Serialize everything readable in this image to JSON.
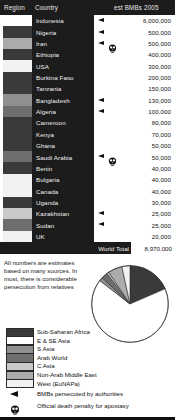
{
  "header": {
    "region_label": "Region",
    "country_label": "Country",
    "est_label": "est BMBs  2005"
  },
  "colors": {
    "sub_saharan_africa": "#3a3a3a",
    "e_se_asia": "#ffffff",
    "s_asia": "#8f8f8f",
    "arab_world": "#6e6e6e",
    "c_asia": "#c9c9c9",
    "non_arab_middle_east": "#ababab",
    "west_eunapa": "#f2f2f2",
    "header_bg": "#1c1c1c",
    "text_light": "#f0f0f0",
    "text_dark": "#111111"
  },
  "table": {
    "rows": [
      {
        "country": "Indonesia",
        "value": "6,000,000",
        "region": "e_se_asia",
        "persecuted": true,
        "death_penalty": false
      },
      {
        "country": "Nigeria",
        "value": "500,000",
        "region": "sub_saharan_africa",
        "persecuted": true,
        "death_penalty": false
      },
      {
        "country": "Iran",
        "value": "500,000",
        "region": "non_arab_middle_east",
        "persecuted": true,
        "death_penalty": true
      },
      {
        "country": "Ethiopia",
        "value": "400,000",
        "region": "sub_saharan_africa",
        "persecuted": false,
        "death_penalty": false
      },
      {
        "country": "USA",
        "value": "300,000",
        "region": "west_eunapa",
        "persecuted": false,
        "death_penalty": false
      },
      {
        "country": "Burkina Faso",
        "value": "200,000",
        "region": "sub_saharan_africa",
        "persecuted": false,
        "death_penalty": false
      },
      {
        "country": "Tanzania",
        "value": "150,000",
        "region": "sub_saharan_africa",
        "persecuted": false,
        "death_penalty": false
      },
      {
        "country": "Bangladesh",
        "value": "130,000",
        "region": "s_asia",
        "persecuted": true,
        "death_penalty": false
      },
      {
        "country": "Algeria",
        "value": "100,000",
        "region": "arab_world",
        "persecuted": true,
        "death_penalty": false
      },
      {
        "country": "Cameroon",
        "value": "80,000",
        "region": "sub_saharan_africa",
        "persecuted": false,
        "death_penalty": false
      },
      {
        "country": "Kenya",
        "value": "70,000",
        "region": "sub_saharan_africa",
        "persecuted": false,
        "death_penalty": false
      },
      {
        "country": "Ghana",
        "value": "50,000",
        "region": "sub_saharan_africa",
        "persecuted": false,
        "death_penalty": false
      },
      {
        "country": "Saudi Arabia",
        "value": "50,000",
        "region": "arab_world",
        "persecuted": true,
        "death_penalty": true
      },
      {
        "country": "Benin",
        "value": "40,000",
        "region": "sub_saharan_africa",
        "persecuted": false,
        "death_penalty": false
      },
      {
        "country": "Bulgaria",
        "value": "40,000",
        "region": "west_eunapa",
        "persecuted": false,
        "death_penalty": false
      },
      {
        "country": "Canada",
        "value": "40,000",
        "region": "west_eunapa",
        "persecuted": false,
        "death_penalty": false
      },
      {
        "country": "Uganda",
        "value": "30,000",
        "region": "sub_saharan_africa",
        "persecuted": false,
        "death_penalty": false
      },
      {
        "country": "Kazakhstan",
        "value": "25,000",
        "region": "c_asia",
        "persecuted": true,
        "death_penalty": false
      },
      {
        "country": "Sudan",
        "value": "25,000",
        "region": "arab_world",
        "persecuted": true,
        "death_penalty": false
      },
      {
        "country": "UK",
        "value": "20,000",
        "region": "west_eunapa",
        "persecuted": false,
        "death_penalty": false
      }
    ],
    "total_label": "World Total",
    "total_value": "8,970,000"
  },
  "note": "All numbers are estimates based on many sources. In most, there is considerable persecution from relatives",
  "chart_data": {
    "type": "pie",
    "title": "",
    "legend_position": "left",
    "categories": [
      "Sub-Saharan Africa",
      "E & SE Asia",
      "S Asia",
      "Arab World",
      "C Asia",
      "Non-Arab Middle East",
      "West (EuNAPa)"
    ],
    "values": [
      18.5,
      67.0,
      1.6,
      2.6,
      0.9,
      6.0,
      3.4
    ],
    "colors": [
      "#3a3a3a",
      "#ffffff",
      "#8f8f8f",
      "#6e6e6e",
      "#c9c9c9",
      "#ababab",
      "#f2f2f2"
    ]
  },
  "legend": {
    "items": [
      {
        "label": "Sub-Saharan Africa",
        "color_key": "sub_saharan_africa"
      },
      {
        "label": "E & SE Asia",
        "color_key": "e_se_asia"
      },
      {
        "label": "S Asia",
        "color_key": "s_asia"
      },
      {
        "label": "Arab World",
        "color_key": "arab_world"
      },
      {
        "label": "C Asia",
        "color_key": "c_asia"
      },
      {
        "label": "Non-Arab Middle East",
        "color_key": "non_arab_middle_east"
      },
      {
        "label": "West (EuNAPa)",
        "color_key": "west_eunapa"
      }
    ],
    "markers": [
      {
        "icon": "arrow-marker",
        "label": "BMBs persecuted by authorities"
      },
      {
        "icon": "skull-marker",
        "label": "Official death penalty for apostasy"
      }
    ]
  }
}
